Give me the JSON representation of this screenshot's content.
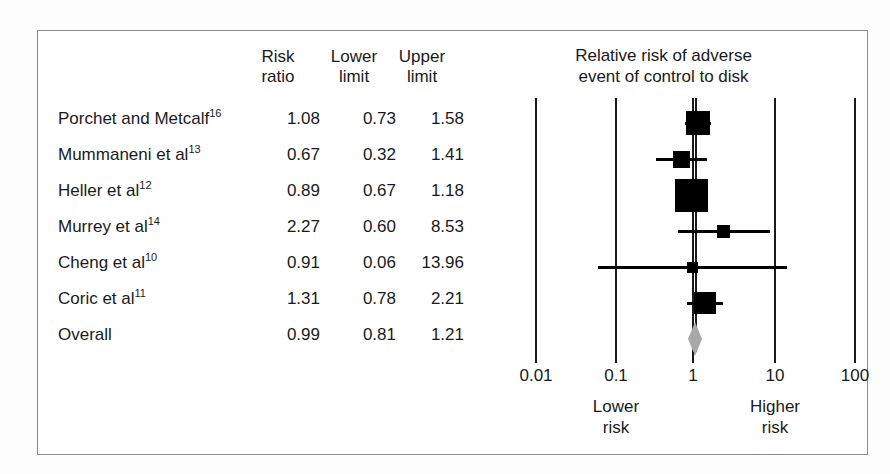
{
  "figure": {
    "kind": "forest-plot",
    "background": "#ffffff",
    "border_color": "#8a8a8a",
    "marker_color": "#000000",
    "summary_color": "#a8a8a8"
  },
  "table": {
    "headers": {
      "study": "",
      "risk_ratio": "Risk\nratio",
      "lower_limit": "Lower\nlimit",
      "upper_limit": "Upper\nlimit"
    },
    "rows": [
      {
        "label": "Porchet and Metcalf",
        "ref": "16",
        "rr": "1.08",
        "lower": "0.73",
        "upper": "1.58"
      },
      {
        "label": "Mummaneni et al",
        "ref": "13",
        "rr": "0.67",
        "lower": "0.32",
        "upper": "1.41"
      },
      {
        "label": "Heller et al",
        "ref": "12",
        "rr": "0.89",
        "lower": "0.67",
        "upper": "1.18"
      },
      {
        "label": "Murrey et al",
        "ref": "14",
        "rr": "2.27",
        "lower": "0.60",
        "upper": "8.53"
      },
      {
        "label": "Cheng et al",
        "ref": "10",
        "rr": "0.91",
        "lower": "0.06",
        "upper": "13.96"
      },
      {
        "label": "Coric et al",
        "ref": "11",
        "rr": "1.31",
        "lower": "0.78",
        "upper": "2.21"
      },
      {
        "label": "Overall",
        "ref": "",
        "rr": "0.99",
        "lower": "0.81",
        "upper": "1.21"
      }
    ]
  },
  "plot": {
    "title": "Relative risk of adverse\nevent of control to disk",
    "axis": {
      "scale": "log",
      "ticks": [
        "0.01",
        "0.1",
        "1",
        "10",
        "100"
      ],
      "tick_values": [
        0.01,
        0.1,
        1,
        10,
        100
      ],
      "left_label": "Lower\nrisk",
      "right_label": "Higher\nrisk",
      "null_line_value": 1
    }
  },
  "chart_data": {
    "type": "forest",
    "title": "Relative risk of adverse event of control to disk",
    "xlabel": "",
    "ylabel": "",
    "xscale": "log",
    "xlim": [
      0.01,
      100
    ],
    "xticks": [
      0.01,
      0.1,
      1,
      10,
      100
    ],
    "xticklabels": [
      "0.01",
      "0.1",
      "1",
      "10",
      "100"
    ],
    "grid": true,
    "legend": "none",
    "null_line": 1,
    "left_annotation": "Lower risk",
    "right_annotation": "Higher risk",
    "columns": [
      "Risk ratio",
      "Lower limit",
      "Upper limit"
    ],
    "studies": [
      {
        "name": "Porchet and Metcalf",
        "ref": 16,
        "rr": 1.08,
        "lower": 0.73,
        "upper": 1.58,
        "weight": 0.2,
        "marker": "square"
      },
      {
        "name": "Mummaneni et al",
        "ref": 13,
        "rr": 0.67,
        "lower": 0.32,
        "upper": 1.41,
        "weight": 0.1,
        "marker": "square"
      },
      {
        "name": "Heller et al",
        "ref": 12,
        "rr": 0.89,
        "lower": 0.67,
        "upper": 1.18,
        "weight": 0.32,
        "marker": "square"
      },
      {
        "name": "Murrey et al",
        "ref": 14,
        "rr": 2.27,
        "lower": 0.6,
        "upper": 8.53,
        "weight": 0.04,
        "marker": "square"
      },
      {
        "name": "Cheng et al",
        "ref": 10,
        "rr": 0.91,
        "lower": 0.06,
        "upper": 13.96,
        "weight": 0.02,
        "marker": "square"
      },
      {
        "name": "Coric et al",
        "ref": 11,
        "rr": 1.31,
        "lower": 0.78,
        "upper": 2.21,
        "weight": 0.16,
        "marker": "square"
      },
      {
        "name": "Overall",
        "ref": null,
        "rr": 0.99,
        "lower": 0.81,
        "upper": 1.21,
        "weight": 1.0,
        "marker": "diamond"
      }
    ]
  }
}
